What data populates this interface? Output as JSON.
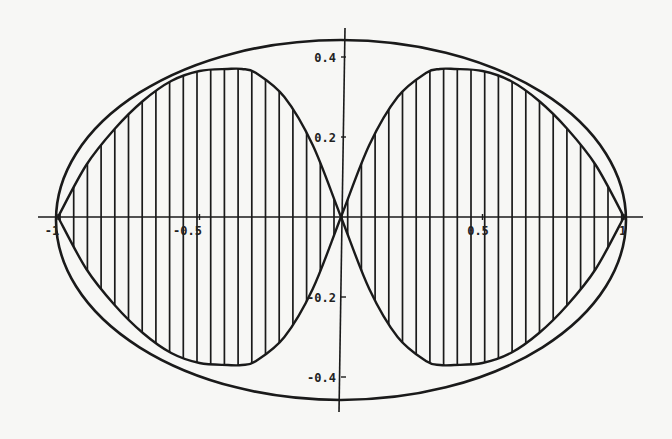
{
  "chart_data": {
    "type": "line",
    "title": "",
    "xlabel": "",
    "ylabel": "",
    "xlim": [
      -1.05,
      1.05
    ],
    "ylim": [
      -0.47,
      0.47
    ],
    "grid": false,
    "legend": null,
    "x_ticks": [
      {
        "value": -1,
        "label": "-1"
      },
      {
        "value": -0.5,
        "label": "-0.5"
      },
      {
        "value": 0.5,
        "label": "0.5"
      },
      {
        "value": 1,
        "label": "1"
      }
    ],
    "y_ticks": [
      {
        "value": 0.4,
        "label": "0.4"
      },
      {
        "value": 0.2,
        "label": "0.2"
      },
      {
        "value": -0.2,
        "label": "-0.2"
      },
      {
        "value": -0.4,
        "label": "-0.4"
      }
    ],
    "series": [
      {
        "name": "outer ellipse",
        "shape": "ellipse",
        "center": [
          0,
          0
        ],
        "semi_axis_x": 1.0,
        "semi_axis_y": 0.45,
        "style": "solid"
      },
      {
        "name": "figure-eight (hatched lobes)",
        "shape": "closed-curve",
        "style": "solid, vertical hatching",
        "x": [
          -1,
          -0.9,
          -0.8,
          -0.7,
          -0.6,
          -0.5,
          -0.4,
          -0.35,
          -0.3,
          -0.2,
          -0.1,
          0,
          0.1,
          0.2,
          0.3,
          0.35,
          0.4,
          0.5,
          0.6,
          0.7,
          0.8,
          0.9,
          1
        ],
        "upper": [
          0,
          0.13,
          0.22,
          0.29,
          0.34,
          0.365,
          0.37,
          0.37,
          0.36,
          0.3,
          0.18,
          0,
          -0.18,
          -0.3,
          -0.36,
          -0.37,
          -0.37,
          -0.365,
          -0.34,
          -0.29,
          -0.22,
          -0.13,
          0
        ],
        "lower": [
          0,
          -0.13,
          -0.22,
          -0.29,
          -0.34,
          -0.365,
          -0.37,
          -0.37,
          -0.36,
          -0.3,
          -0.18,
          0,
          0.18,
          0.3,
          0.36,
          0.37,
          0.37,
          0.365,
          0.34,
          0.29,
          0.22,
          0.13,
          0
        ]
      }
    ],
    "annotations": []
  }
}
